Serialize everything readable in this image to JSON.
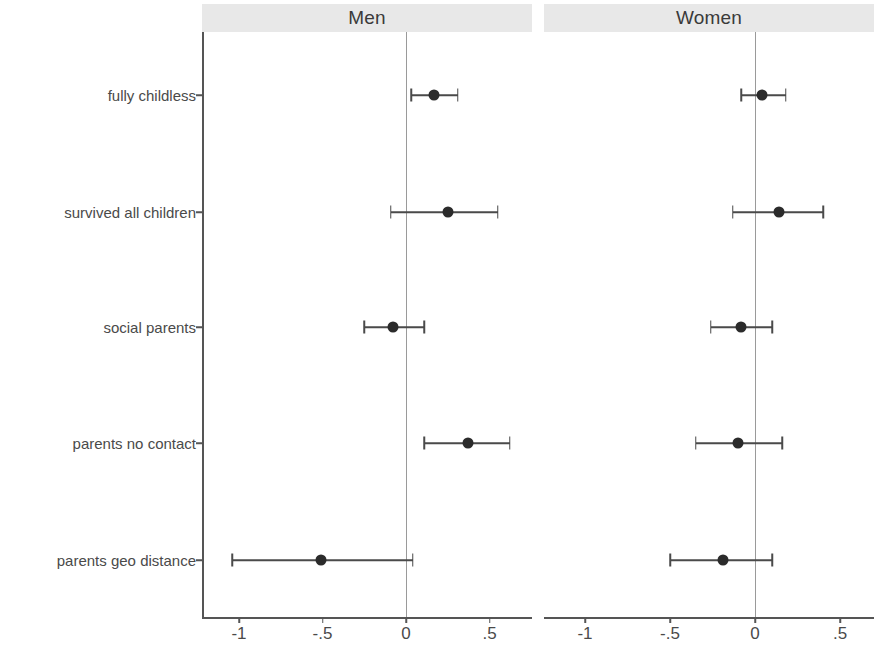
{
  "figure": {
    "background": "#ffffff",
    "point_color": "#2b2b2b",
    "line_color": "#4a4a4a",
    "axis_color": "#555555",
    "zeroline_color": "#9a9a9a",
    "header_band_color": "#e8e8e8"
  },
  "chart_data": {
    "type": "scatter",
    "subtype": "coefficient-plot-with-confidence-intervals",
    "title": "",
    "xlabel": "",
    "ylabel": "",
    "grid": false,
    "legend": null,
    "zero_reference_line": 0,
    "categories": [
      "fully childless",
      "survived all children",
      "social parents",
      "parents no contact",
      "parents geo distance"
    ],
    "panels": [
      {
        "name": "Men",
        "xlim": [
          -1.28,
          0.73
        ],
        "xticks": [
          -1,
          -0.5,
          0,
          0.5
        ],
        "xticklabels": [
          "-1",
          "-.5",
          "0",
          ".5"
        ],
        "points": [
          {
            "category": "fully childless",
            "estimate": 0.17,
            "ci_low": 0.03,
            "ci_high": 0.31
          },
          {
            "category": "survived all children",
            "estimate": 0.25,
            "ci_low": -0.09,
            "ci_high": 0.55
          },
          {
            "category": "social parents",
            "estimate": -0.08,
            "ci_low": -0.25,
            "ci_high": 0.11
          },
          {
            "category": "parents no contact",
            "estimate": 0.37,
            "ci_low": 0.11,
            "ci_high": 0.62
          },
          {
            "category": "parents geo distance",
            "estimate": -0.51,
            "ci_low": -1.04,
            "ci_high": 0.04
          }
        ]
      },
      {
        "name": "Women",
        "xlim": [
          -1.28,
          0.73
        ],
        "xticks": [
          -1,
          -0.5,
          0,
          0.5
        ],
        "xticklabels": [
          "-1",
          "-.5",
          "0",
          ".5"
        ],
        "points": [
          {
            "category": "fully childless",
            "estimate": 0.04,
            "ci_low": -0.08,
            "ci_high": 0.18
          },
          {
            "category": "survived all children",
            "estimate": 0.14,
            "ci_low": -0.13,
            "ci_high": 0.4
          },
          {
            "category": "social parents",
            "estimate": -0.08,
            "ci_low": -0.26,
            "ci_high": 0.1
          },
          {
            "category": "parents no contact",
            "estimate": -0.1,
            "ci_low": -0.35,
            "ci_high": 0.16
          },
          {
            "category": "parents geo distance",
            "estimate": -0.19,
            "ci_low": -0.5,
            "ci_high": 0.1
          }
        ]
      }
    ]
  },
  "layout": {
    "panel_pixel_geometry": [
      {
        "name": "Men",
        "header_left": 202,
        "header_width": 330,
        "plot_left": 202,
        "plot_right": 532,
        "zero_x": 406,
        "unit_px": 167
      },
      {
        "name": "Women",
        "header_left": 544,
        "header_width": 330,
        "plot_left": 544,
        "plot_right": 874,
        "zero_x": 755,
        "unit_px": 170
      }
    ],
    "row_y": [
      95,
      212,
      327,
      443,
      560
    ],
    "plot_top": 32,
    "plot_bottom": 617,
    "xticklabel_y": 624
  }
}
